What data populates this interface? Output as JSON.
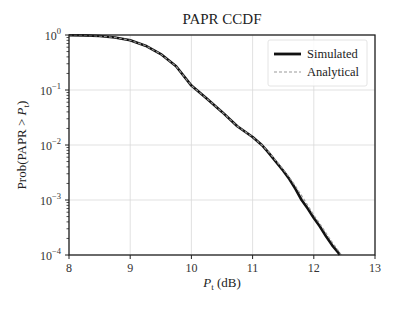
{
  "chart_data": {
    "type": "line",
    "title": "PAPR CCDF",
    "xlabel": "P_t (dB)",
    "xlabel_main": "P",
    "xlabel_sub": "t",
    "xlabel_unit": "(dB)",
    "ylabel": "Prob(PAPR > P_t)",
    "ylabel_main": "Prob(PAPR > ",
    "ylabel_var": "P",
    "ylabel_sub": "t",
    "ylabel_close": ")",
    "xlim": [
      8,
      13
    ],
    "ylim": [
      0.0001,
      1
    ],
    "yscale": "log",
    "grid": true,
    "legend_position": "upper right",
    "x_ticks": [
      "8",
      "9",
      "10",
      "11",
      "12",
      "13"
    ],
    "y_ticks": [
      {
        "base": "10",
        "exp": "0"
      },
      {
        "base": "10",
        "exp": "−1"
      },
      {
        "base": "10",
        "exp": "−2"
      },
      {
        "base": "10",
        "exp": "−3"
      },
      {
        "base": "10",
        "exp": "−4"
      }
    ],
    "series": [
      {
        "name": "Simulated",
        "style": "solid",
        "color": "#111111",
        "x": [
          8.0,
          8.25,
          8.5,
          8.75,
          9.0,
          9.25,
          9.5,
          9.75,
          10.0,
          10.25,
          10.5,
          10.75,
          11.0,
          11.15,
          11.25,
          11.5,
          11.6,
          11.7,
          11.8,
          11.9,
          12.0,
          12.1,
          12.2,
          12.3,
          12.4,
          12.42
        ],
        "y": [
          0.99,
          0.985,
          0.96,
          0.9,
          0.8,
          0.64,
          0.45,
          0.27,
          0.12,
          0.07,
          0.04,
          0.022,
          0.014,
          0.01,
          0.0075,
          0.0034,
          0.0024,
          0.0016,
          0.001,
          0.0007,
          0.00047,
          0.00033,
          0.00022,
          0.00015,
          0.00011,
          0.0001
        ]
      },
      {
        "name": "Analytical",
        "style": "dashed",
        "color": "#9a9a9a",
        "x": [
          8.0,
          8.25,
          8.5,
          8.75,
          9.0,
          9.25,
          9.5,
          9.75,
          10.0,
          10.25,
          10.5,
          10.75,
          11.0,
          11.15,
          11.25,
          11.5,
          11.6,
          11.7,
          11.8,
          11.9,
          12.0,
          12.1,
          12.2,
          12.3,
          12.4,
          12.45
        ],
        "y": [
          0.99,
          0.985,
          0.96,
          0.9,
          0.8,
          0.64,
          0.45,
          0.27,
          0.12,
          0.07,
          0.04,
          0.022,
          0.014,
          0.01,
          0.0077,
          0.0036,
          0.0026,
          0.0018,
          0.0012,
          0.0008,
          0.00053,
          0.00037,
          0.00025,
          0.00017,
          0.00012,
          0.0001
        ]
      }
    ]
  },
  "legend": {
    "items": [
      {
        "label": "Simulated"
      },
      {
        "label": "Analytical"
      }
    ]
  }
}
